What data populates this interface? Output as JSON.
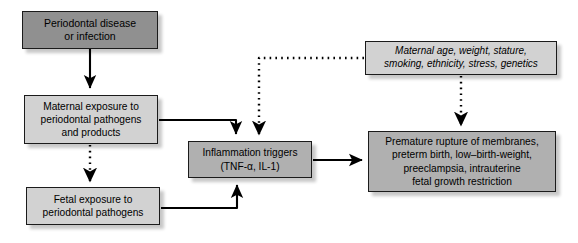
{
  "diagram": {
    "colors": {
      "box_fill_dark": "#909090",
      "box_fill_mid": "#b0b0b0",
      "box_fill_light": "#d2d2d2",
      "border": "#1b1b1b",
      "line": "#000000",
      "background": "#ffffff"
    },
    "nodes": [
      {
        "id": "disease",
        "label": "Periodontal disease\nor infection",
        "style": "dark"
      },
      {
        "id": "maternal_exposure",
        "label": "Maternal exposure to\nperiodontal pathogens\nand products",
        "style": "light"
      },
      {
        "id": "fetal_exposure",
        "label": "Fetal exposure to\nperiodontal pathogens",
        "style": "light"
      },
      {
        "id": "inflammation",
        "label": "Inflammation triggers\n(TNF-α, IL-1)",
        "style": "mid"
      },
      {
        "id": "modifiers",
        "label": "Maternal age, weight, stature,\nsmoking, ethnicity, stress, genetics",
        "style": "light"
      },
      {
        "id": "outcomes",
        "label": "Premature rupture of membranes,\npreterm birth, low–birth-weight,\npreeclampsia, intrauterine\nfetal growth restriction",
        "style": "mid"
      }
    ],
    "edges": [
      {
        "id": "disease-to-maternal",
        "from": "disease",
        "to": "maternal_exposure",
        "style": "solid"
      },
      {
        "id": "maternal-to-fetal",
        "from": "maternal_exposure",
        "to": "fetal_exposure",
        "style": "dotted"
      },
      {
        "id": "maternal-to-inflammation",
        "from": "maternal_exposure",
        "to": "inflammation",
        "style": "solid"
      },
      {
        "id": "fetal-to-inflammation",
        "from": "fetal_exposure",
        "to": "inflammation",
        "style": "solid"
      },
      {
        "id": "modifiers-to-inflammation",
        "from": "modifiers",
        "to": "inflammation",
        "style": "dotted"
      },
      {
        "id": "modifiers-to-outcomes",
        "from": "modifiers",
        "to": "outcomes",
        "style": "dotted"
      },
      {
        "id": "inflammation-to-outcomes",
        "from": "inflammation",
        "to": "outcomes",
        "style": "solid"
      }
    ]
  }
}
